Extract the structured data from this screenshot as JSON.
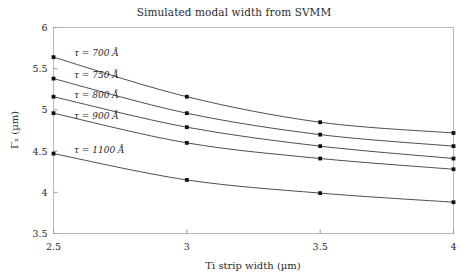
{
  "chart_data": {
    "type": "line",
    "title": "Simulated modal width from SVMM",
    "xlabel": "Ti strip width (µm)",
    "ylabel": "Γₓ (µm)",
    "x": [
      2.5,
      3,
      3.5,
      4
    ],
    "xtick_labels": [
      "2.5",
      "3",
      "3.5",
      "4"
    ],
    "ytick_labels": [
      "3.5",
      "4",
      "4.5",
      "5",
      "5.5",
      "6"
    ],
    "yticks": [
      3.5,
      4,
      4.5,
      5,
      5.5,
      6
    ],
    "xlim": [
      2.5,
      4
    ],
    "ylim": [
      3.5,
      6
    ],
    "grid": false,
    "legend_position": "inline-annotations",
    "marker": "square",
    "line_color": "#3a3a3a",
    "marker_color": "#111111",
    "series": [
      {
        "name": "τ = 700 Å",
        "tau_value": "700",
        "tau_unit": "Å",
        "values": [
          5.64,
          5.16,
          4.85,
          4.72
        ]
      },
      {
        "name": "τ = 750 Å",
        "tau_value": "750",
        "tau_unit": "Å",
        "values": [
          5.38,
          4.96,
          4.7,
          4.56
        ]
      },
      {
        "name": "τ = 800 Å",
        "tau_value": "800",
        "tau_unit": "Å",
        "values": [
          5.16,
          4.79,
          4.56,
          4.41
        ]
      },
      {
        "name": "τ = 900 Å",
        "tau_value": "900",
        "tau_unit": "Å",
        "values": [
          4.96,
          4.6,
          4.41,
          4.28
        ]
      },
      {
        "name": "τ = 1100 Å",
        "tau_value": "1100",
        "tau_unit": "Å",
        "values": [
          4.47,
          4.15,
          3.99,
          3.88
        ]
      }
    ],
    "annotations": [
      {
        "text": "τ = 700 Å",
        "x_px": 74,
        "y_px": 56
      },
      {
        "text": "τ = 750 Å",
        "x_px": 74,
        "y_px": 78
      },
      {
        "text": "τ = 800 Å",
        "x_px": 74,
        "y_px": 98
      },
      {
        "text": "τ = 900 Å",
        "x_px": 74,
        "y_px": 119
      },
      {
        "text": "τ = 1100 Å",
        "x_px": 74,
        "y_px": 153
      }
    ]
  }
}
